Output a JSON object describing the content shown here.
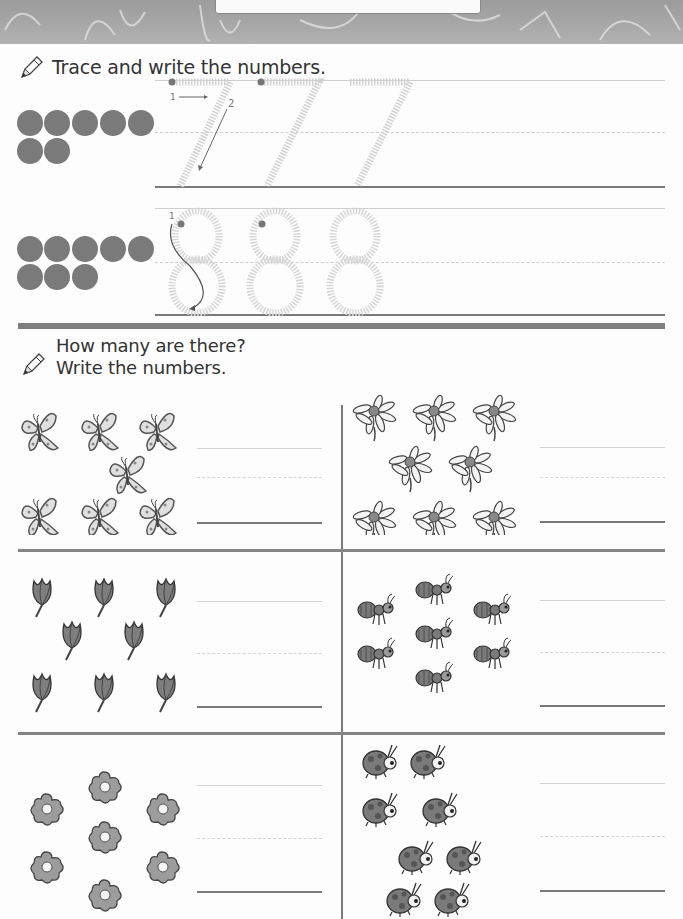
{
  "worksheet": {
    "section1": {
      "instruction": "Trace and write the numbers.",
      "rows": [
        {
          "digit": "7",
          "dot_count": 7,
          "stroke_labels": [
            "1",
            "2"
          ]
        },
        {
          "digit": "8",
          "dot_count": 8,
          "stroke_labels": [
            "1"
          ]
        }
      ]
    },
    "section2": {
      "instruction_line1": "How many are there?",
      "instruction_line2": "Write the numbers.",
      "panels": [
        {
          "item": "butterfly",
          "count": 7
        },
        {
          "item": "daisy",
          "count": 8
        },
        {
          "item": "tulip",
          "count": 8
        },
        {
          "item": "ant",
          "count": 7
        },
        {
          "item": "flower",
          "count": 7
        },
        {
          "item": "ladybug",
          "count": 8
        }
      ]
    }
  },
  "colors": {
    "ink": "#3a3a3a",
    "dot": "#7a7a7a",
    "trace": "#d2d2d2",
    "rule": "#7a7a7a",
    "banner": "#a4a4a4"
  }
}
